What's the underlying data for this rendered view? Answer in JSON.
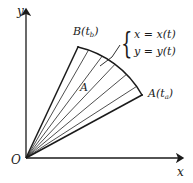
{
  "figure": {
    "axes": {
      "y_label": "y",
      "x_label": "x",
      "origin_label": "O"
    },
    "points": {
      "upper": {
        "name": "B",
        "param": "t",
        "subscript": "b",
        "text": "B(t"
      },
      "lower": {
        "name": "A",
        "param": "t",
        "subscript": "a",
        "text": "A(t"
      }
    },
    "region": {
      "area_label": "A"
    },
    "parametric": {
      "brace": "{",
      "equation_x": "x = x(t)",
      "equation_y": "y = y(t)"
    },
    "colors": {
      "ink": "#1a1a1a",
      "hatch": "#3a3a3a",
      "background": "#ffffff"
    }
  }
}
